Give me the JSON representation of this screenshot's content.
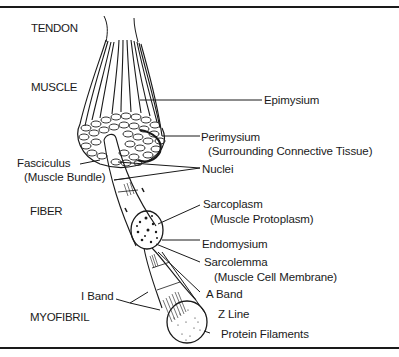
{
  "diagram": {
    "type": "anatomy-illustration",
    "colors": {
      "ink": "#1a1a1a",
      "background": "#ffffff"
    },
    "sections": [
      {
        "id": "tendon",
        "label": "TENDON"
      },
      {
        "id": "muscle",
        "label": "MUSCLE"
      },
      {
        "id": "fiber",
        "label": "FIBER"
      },
      {
        "id": "myofibril",
        "label": "MYOFIBRIL"
      }
    ],
    "labels": {
      "epimysium": "Epimysium",
      "perimysium": "Perimysium",
      "perimysium_note": "(Surrounding Connective Tissue)",
      "fasciculus": "Fasciculus",
      "fasciculus_note": "(Muscle Bundle)",
      "nuclei": "Nuclei",
      "sarcoplasm": "Sarcoplasm",
      "sarcoplasm_note": "(Muscle Protoplasm)",
      "endomysium": "Endomysium",
      "sarcolemma": "Sarcolemma",
      "sarcolemma_note": "(Muscle Cell Membrane)",
      "i_band": "I Band",
      "a_band": "A Band",
      "z_line": "Z Line",
      "protein_filaments": "Protein Filaments"
    }
  }
}
